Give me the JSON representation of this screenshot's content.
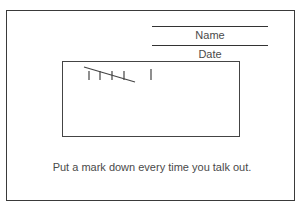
{
  "form": {
    "name_label": "Name",
    "date_label": "Date",
    "instruction": "Put a mark down every time you talk out."
  },
  "tally": {
    "count": 6,
    "groups": [
      5,
      1
    ],
    "icon": "tally-marks-icon"
  }
}
